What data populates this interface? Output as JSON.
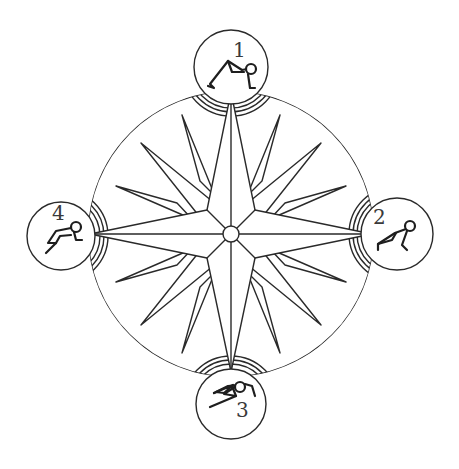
{
  "diagram": {
    "type": "compass-rose",
    "colors": {
      "stroke": "#2a2a2a",
      "background": "#ffffff"
    },
    "center": {
      "x": 231,
      "y": 234
    },
    "medallions": [
      {
        "number": "1",
        "position": "top",
        "figure": "bridge-pose-figure"
      },
      {
        "number": "2",
        "position": "right",
        "figure": "plank-pose-figure"
      },
      {
        "number": "3",
        "position": "bottom",
        "figure": "diving-figure"
      },
      {
        "number": "4",
        "position": "left",
        "figure": "crouching-figure"
      }
    ]
  }
}
